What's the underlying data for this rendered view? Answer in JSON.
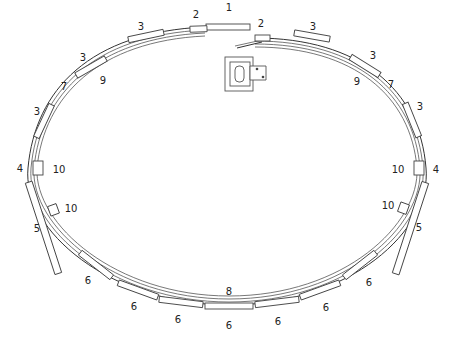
{
  "diagram": {
    "type": "storage-ring-schematic",
    "labels": [
      {
        "id": "l1",
        "text": "1",
        "x": 229,
        "y": 8
      },
      {
        "id": "l2a",
        "text": "2",
        "x": 196,
        "y": 15
      },
      {
        "id": "l2b",
        "text": "2",
        "x": 261,
        "y": 24
      },
      {
        "id": "l3a",
        "text": "3",
        "x": 141,
        "y": 27
      },
      {
        "id": "l3b",
        "text": "3",
        "x": 313,
        "y": 27
      },
      {
        "id": "l3c",
        "text": "3",
        "x": 83,
        "y": 58
      },
      {
        "id": "l3d",
        "text": "3",
        "x": 373,
        "y": 56
      },
      {
        "id": "l3e",
        "text": "3",
        "x": 37,
        "y": 112
      },
      {
        "id": "l3f",
        "text": "3",
        "x": 420,
        "y": 107
      },
      {
        "id": "l7a",
        "text": "7",
        "x": 64,
        "y": 87
      },
      {
        "id": "l7b",
        "text": "7",
        "x": 391,
        "y": 85
      },
      {
        "id": "l9a",
        "text": "9",
        "x": 103,
        "y": 81
      },
      {
        "id": "l9b",
        "text": "9",
        "x": 357,
        "y": 82
      },
      {
        "id": "l4a",
        "text": "4",
        "x": 20,
        "y": 169
      },
      {
        "id": "l4b",
        "text": "4",
        "x": 436,
        "y": 170
      },
      {
        "id": "l10a",
        "text": "10",
        "x": 59,
        "y": 170
      },
      {
        "id": "l10b",
        "text": "10",
        "x": 398,
        "y": 170
      },
      {
        "id": "l10c",
        "text": "10",
        "x": 71,
        "y": 209
      },
      {
        "id": "l10d",
        "text": "10",
        "x": 388,
        "y": 206
      },
      {
        "id": "l5a",
        "text": "5",
        "x": 37,
        "y": 229
      },
      {
        "id": "l5b",
        "text": "5",
        "x": 419,
        "y": 228
      },
      {
        "id": "l6a",
        "text": "6",
        "x": 88,
        "y": 281
      },
      {
        "id": "l6b",
        "text": "6",
        "x": 134,
        "y": 307
      },
      {
        "id": "l6c",
        "text": "6",
        "x": 178,
        "y": 320
      },
      {
        "id": "l6d",
        "text": "6",
        "x": 229,
        "y": 326
      },
      {
        "id": "l6e",
        "text": "6",
        "x": 278,
        "y": 322
      },
      {
        "id": "l6f",
        "text": "6",
        "x": 326,
        "y": 308
      },
      {
        "id": "l6g",
        "text": "6",
        "x": 369,
        "y": 283
      },
      {
        "id": "l8",
        "text": "8",
        "x": 229,
        "y": 292
      }
    ],
    "center_device": {
      "name": "injector-block",
      "x": 225,
      "y": 57,
      "w": 44,
      "h": 38
    }
  }
}
